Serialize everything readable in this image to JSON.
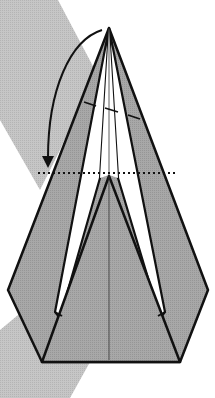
{
  "diagram": {
    "type": "origami-fold-step",
    "description": "Fold the top point down to the dotted line",
    "colors": {
      "background_band": "#c8c8c8",
      "paper_colored": "#a9a9a9",
      "paper_white": "#ffffff",
      "line": "#111111"
    },
    "elements": {
      "apex": [
        109,
        28
      ],
      "valley_fold_line_y": 173,
      "arrow": "curved-fold-arrow",
      "fold_marker": "dashed crease mark",
      "center_crease": "thin vertical line"
    }
  }
}
